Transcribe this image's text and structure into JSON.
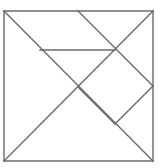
{
  "figure": {
    "kind": "tangram-dissection-diagram",
    "canvas": {
      "width": 167,
      "height": 168,
      "background": "#ffffff"
    },
    "stroke": {
      "color": "#6a6a6a",
      "width": 1.4,
      "linecap": "square"
    },
    "square": {
      "label": "outer-square",
      "left": 4,
      "top": 11,
      "right": 153,
      "bottom": 161
    },
    "points": {
      "top_left": {
        "label": "A",
        "x": 4,
        "y": 11
      },
      "top_mid": {
        "label": "B",
        "x": 78,
        "y": 11
      },
      "top_right": {
        "label": "C",
        "x": 153,
        "y": 11
      },
      "right_mid": {
        "label": "D",
        "x": 153,
        "y": 86
      },
      "bottom_right": {
        "label": "E",
        "x": 153,
        "y": 161
      },
      "bottom_left": {
        "label": "F",
        "x": 4,
        "y": 161
      },
      "center": {
        "label": "G",
        "x": 78,
        "y": 87
      },
      "square_top": {
        "label": "H",
        "x": 115,
        "y": 50
      },
      "square_bottom": {
        "label": "I",
        "x": 115,
        "y": 124
      },
      "bar_left": {
        "label": "J",
        "x": 40,
        "y": 50
      }
    },
    "segments": [
      {
        "name": "border-top",
        "x1": 4,
        "y1": 11,
        "x2": 153,
        "y2": 11
      },
      {
        "name": "border-right",
        "x1": 153,
        "y1": 11,
        "x2": 153,
        "y2": 161
      },
      {
        "name": "border-bottom",
        "x1": 153,
        "y1": 161,
        "x2": 4,
        "y2": 161
      },
      {
        "name": "border-left",
        "x1": 4,
        "y1": 161,
        "x2": 4,
        "y2": 11
      },
      {
        "name": "main-diagonal",
        "x1": 4,
        "y1": 11,
        "x2": 153,
        "y2": 161
      },
      {
        "name": "anti-diagonal",
        "x1": 153,
        "y1": 11,
        "x2": 4,
        "y2": 161
      },
      {
        "name": "top-mid-to-right-mid",
        "x1": 78,
        "y1": 11,
        "x2": 153,
        "y2": 86
      },
      {
        "name": "horizontal-bar",
        "x1": 40,
        "y1": 50,
        "x2": 115,
        "y2": 50
      },
      {
        "name": "square-lower-right",
        "x1": 153,
        "y1": 86,
        "x2": 115,
        "y2": 124
      },
      {
        "name": "square-lower-left",
        "x1": 115,
        "y1": 124,
        "x2": 78,
        "y2": 87
      }
    ],
    "pieces": [
      {
        "name": "large-triangle-left",
        "points": "4,11 78,87 4,161"
      },
      {
        "name": "large-triangle-bottom",
        "points": "4,161 78,87 153,161"
      },
      {
        "name": "medium-triangle-top",
        "points": "40,50 115,50 78,87"
      },
      {
        "name": "small-triangle-upper",
        "points": "78,11 115,50 40,50"
      },
      {
        "name": "small-triangle-right",
        "points": "115,50 153,86 115,124"
      },
      {
        "name": "square-piece",
        "points": "78,87 115,50 153,86 115,124"
      },
      {
        "name": "triangle-top-right",
        "points": "78,11 153,11 153,86"
      }
    ]
  }
}
